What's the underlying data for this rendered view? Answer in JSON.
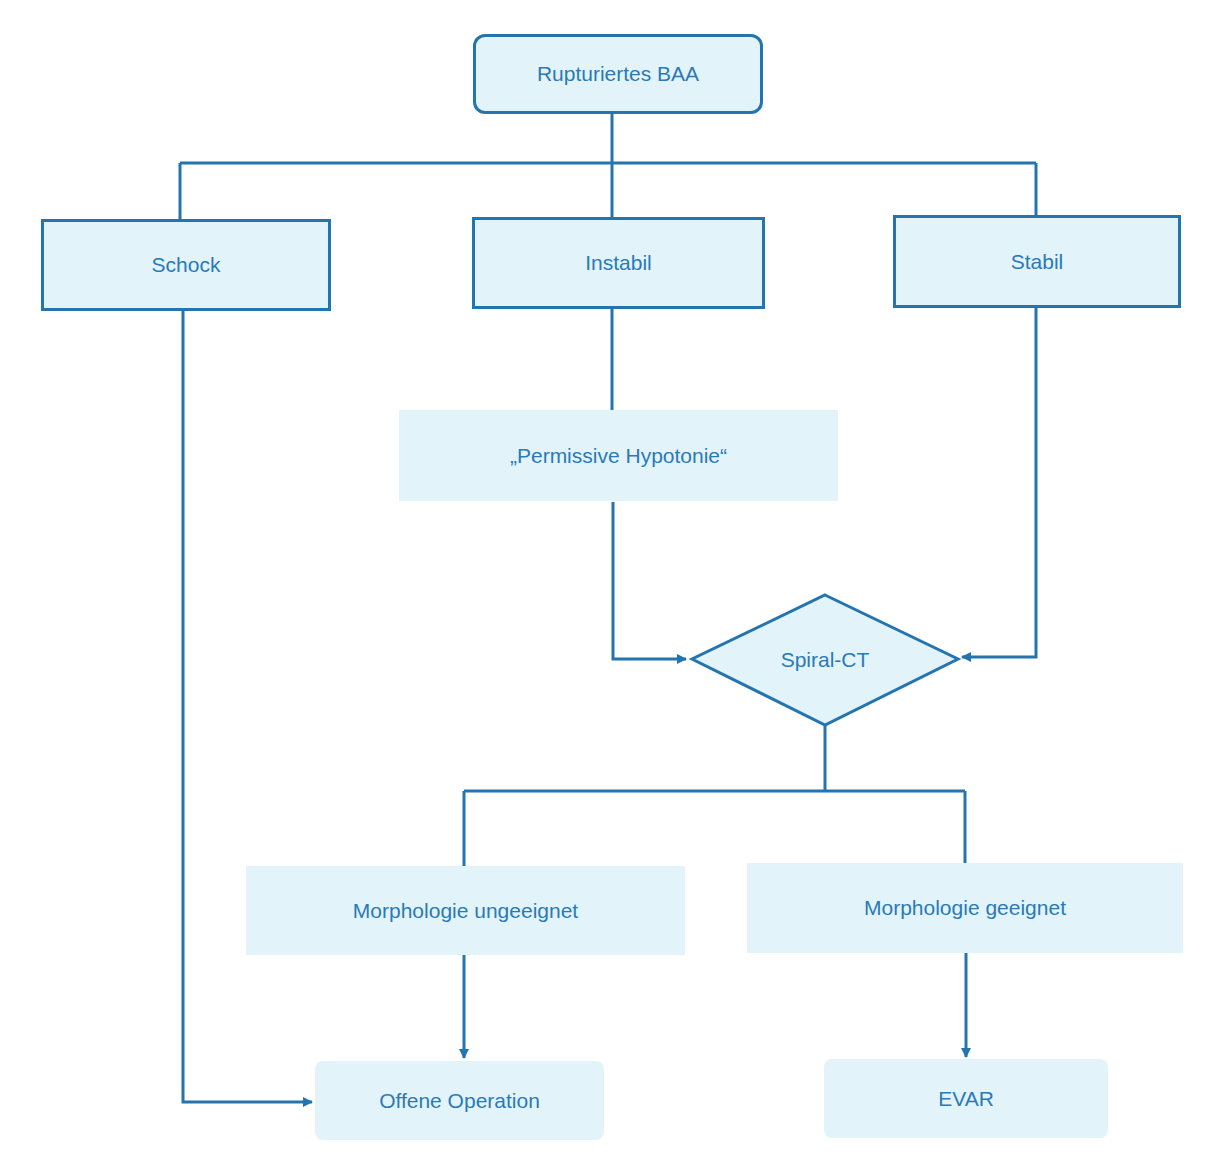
{
  "diagram": {
    "type": "flowchart",
    "colors": {
      "line": "#2474b0",
      "text": "#2a7ab8",
      "fill": "#e2f4fa"
    },
    "nodes": {
      "root": {
        "label": "Rupturiertes BAA",
        "shape": "rounded-rect"
      },
      "schock": {
        "label": "Schock",
        "shape": "rect"
      },
      "instabil": {
        "label": "Instabil",
        "shape": "rect"
      },
      "stabil": {
        "label": "Stabil",
        "shape": "rect"
      },
      "permissive": {
        "label": "„Permissive Hypotonie“",
        "shape": "shaded-rect"
      },
      "spiral_ct": {
        "label": "Spiral-CT",
        "shape": "diamond"
      },
      "ungeeignet": {
        "label": "Morphologie ungeeignet",
        "shape": "shaded-rect"
      },
      "geeignet": {
        "label": "Morphologie geeignet",
        "shape": "shaded-rect"
      },
      "offene_op": {
        "label": "Offene Operation",
        "shape": "shaded-rounded-rect"
      },
      "evar": {
        "label": "EVAR",
        "shape": "shaded-rounded-rect"
      }
    },
    "edges": [
      {
        "from": "root",
        "to": "schock"
      },
      {
        "from": "root",
        "to": "instabil"
      },
      {
        "from": "root",
        "to": "stabil"
      },
      {
        "from": "instabil",
        "to": "permissive"
      },
      {
        "from": "permissive",
        "to": "spiral_ct",
        "arrow": true
      },
      {
        "from": "stabil",
        "to": "spiral_ct",
        "arrow": true
      },
      {
        "from": "spiral_ct",
        "to": "ungeeignet"
      },
      {
        "from": "spiral_ct",
        "to": "geeignet"
      },
      {
        "from": "ungeeignet",
        "to": "offene_op",
        "arrow": true
      },
      {
        "from": "geeignet",
        "to": "evar",
        "arrow": true
      },
      {
        "from": "schock",
        "to": "offene_op",
        "arrow": true
      }
    ]
  }
}
